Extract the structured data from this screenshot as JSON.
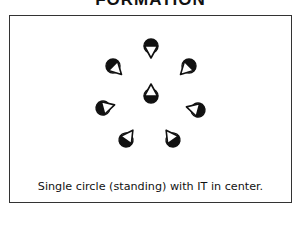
{
  "title": "FORMATION",
  "caption": "Single circle (standing) with IT in center.",
  "colors": {
    "ink": "#111111",
    "frame": "#333333",
    "background": "#ffffff"
  },
  "players": [
    {
      "id": "top",
      "cx": 151,
      "cy": 46,
      "angle": 180,
      "role": "circle"
    },
    {
      "id": "upper-right",
      "cx": 189,
      "cy": 66,
      "angle": 225,
      "role": "circle"
    },
    {
      "id": "right",
      "cx": 198,
      "cy": 110,
      "angle": 285,
      "role": "circle"
    },
    {
      "id": "bottom-right",
      "cx": 173,
      "cy": 140,
      "angle": 325,
      "role": "circle"
    },
    {
      "id": "bottom-left",
      "cx": 126,
      "cy": 140,
      "angle": 35,
      "role": "circle"
    },
    {
      "id": "left",
      "cx": 103,
      "cy": 108,
      "angle": 75,
      "role": "circle"
    },
    {
      "id": "upper-left",
      "cx": 113,
      "cy": 66,
      "angle": 135,
      "role": "circle"
    },
    {
      "id": "center",
      "cx": 151,
      "cy": 96,
      "angle": 0,
      "role": "IT"
    }
  ]
}
